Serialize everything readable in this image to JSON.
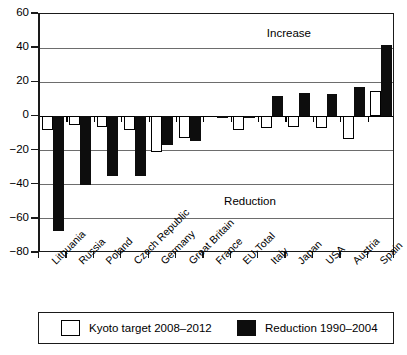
{
  "chart_data": {
    "type": "bar",
    "title": "",
    "xlabel": "",
    "ylabel": "",
    "ylim": [
      -80,
      60
    ],
    "yticks": [
      60,
      40,
      20,
      0,
      -20,
      -40,
      -60,
      -80
    ],
    "ytick_labels": [
      "60",
      "40",
      "20",
      "0",
      "−20",
      "−40",
      "−60",
      "−80"
    ],
    "grid": true,
    "legend_position": "bottom",
    "categories": [
      "Lithuania",
      "Russia",
      "Poland",
      "Czech Republic",
      "Germany",
      "Great Britain",
      "France",
      "EU-Total",
      "Italy",
      "Japan",
      "USA",
      "Austria",
      "Spain"
    ],
    "series": [
      {
        "name": "Kyoto target 2008–2012",
        "color": "#ffffff",
        "values": [
          -8,
          -5,
          -6,
          -8,
          -21,
          -12.5,
          0,
          -8,
          -6.5,
          -6,
          -7,
          -13,
          15
        ]
      },
      {
        "name": "Reduction 1990–2004",
        "color": "#0d0d0d",
        "values": [
          -67,
          -40,
          -35,
          -35,
          -17,
          -14.5,
          -0.8,
          -1,
          12,
          13.5,
          13,
          17,
          42
        ]
      }
    ],
    "annotations": [
      {
        "text": "Increase",
        "x_frac": 0.64,
        "y_value": 48
      },
      {
        "text": "Reduction",
        "x_frac": 0.52,
        "y_value": -50
      }
    ]
  },
  "legend": {
    "items": [
      {
        "label": "Kyoto target 2008–2012",
        "swatch": "white"
      },
      {
        "label": "Reduction 1990–2004",
        "swatch": "black"
      }
    ]
  }
}
